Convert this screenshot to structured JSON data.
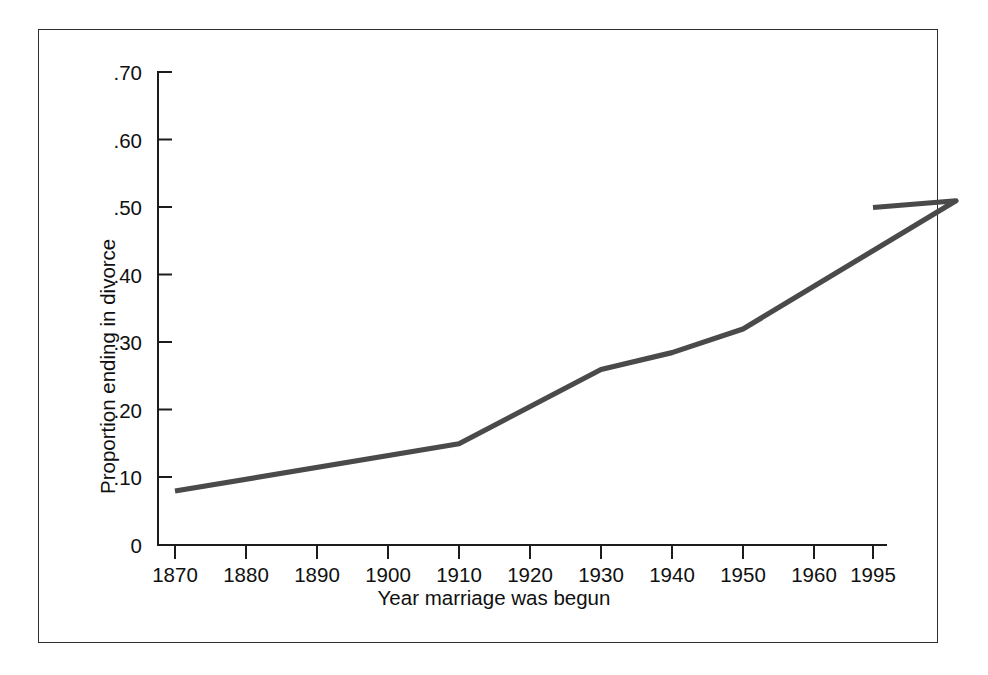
{
  "chart_data": {
    "type": "line",
    "title": "",
    "xlabel": "Year marriage was begun",
    "ylabel": "Proportion ending in divorce",
    "x": [
      1870,
      1910,
      1930,
      1940,
      1950,
      1980,
      1995
    ],
    "values": [
      0.08,
      0.15,
      0.26,
      0.285,
      0.32,
      0.51,
      0.5
    ],
    "series": [
      {
        "name": "Proportion ending in divorce",
        "points": [
          {
            "x": 1870,
            "y": 0.08
          },
          {
            "x": 1910,
            "y": 0.15
          },
          {
            "x": 1930,
            "y": 0.26
          },
          {
            "x": 1940,
            "y": 0.285
          },
          {
            "x": 1950,
            "y": 0.32
          },
          {
            "x": 1980,
            "y": 0.51
          },
          {
            "x": 1995,
            "y": 0.5
          }
        ],
        "color": "#4a4a4a"
      }
    ],
    "xlim": [
      1865,
      2000
    ],
    "ylim": [
      0,
      0.7
    ],
    "xticks": [
      1870,
      1880,
      1890,
      1900,
      1910,
      1920,
      1930,
      1940,
      1950,
      1960,
      1970,
      1980,
      1995
    ],
    "xticklabels": [
      "1870",
      "1880",
      "1890",
      "1900",
      "1910",
      "1920",
      "1930",
      "1940",
      "1950",
      "1960",
      "1970",
      "1980",
      "1995"
    ],
    "yticks": [
      0,
      0.1,
      0.2,
      0.3,
      0.4,
      0.5,
      0.6,
      0.7
    ],
    "yticklabels": [
      "0",
      ".10",
      ".20",
      ".30",
      ".40",
      ".50",
      ".60",
      ".70"
    ],
    "grid": false,
    "legend": false,
    "legend_position": "none",
    "line_color": "#4a4a4a",
    "axis_color": "#1c1c1c",
    "frame_color": "#2e2e2e",
    "background": "#ffffff"
  }
}
